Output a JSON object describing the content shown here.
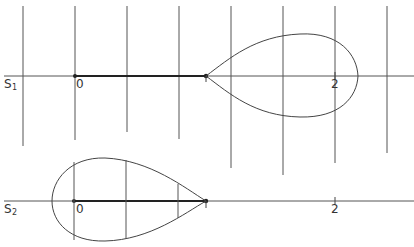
{
  "figure": {
    "panel_top": {
      "axis_label": "S",
      "axis_subscript": "1",
      "tick_labels": [
        "1",
        "0",
        "1",
        "2"
      ],
      "left_label": "-1",
      "origin_label": "0",
      "one_label": "1",
      "two_label": "2"
    },
    "panel_bottom": {
      "axis_label": "S",
      "axis_subscript": "2",
      "origin_label": "0",
      "one_label": "1",
      "two_label": "2"
    },
    "colors": {
      "stroke": "#444444",
      "background": "#ffffff"
    }
  }
}
